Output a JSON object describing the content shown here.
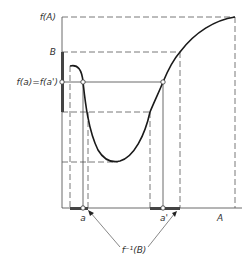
{
  "diagram": {
    "type": "function-preimage-illustration",
    "labels": {
      "fA": "f(A)",
      "B": "B",
      "fa_eq": "f(a)=f(a')",
      "a": "a",
      "a_prime": "a'",
      "A": "A",
      "preimage": "f⁻¹(B)"
    },
    "colors": {
      "line": "#1a1a1a",
      "dash": "#555555",
      "background": "#ffffff"
    }
  }
}
